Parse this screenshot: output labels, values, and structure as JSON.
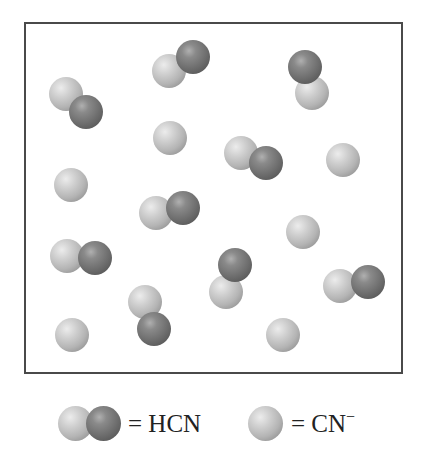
{
  "diagram": {
    "title": "",
    "container": {
      "left": 24,
      "top": 22,
      "right": 403,
      "bottom": 374,
      "border_color": "#4a4a4a"
    },
    "sphere_colors": {
      "light": "#c0c0c0",
      "dark": "#6f6f6f"
    },
    "sphere_radius": 17,
    "molecules": [
      {
        "type": "HCN",
        "spheres": [
          {
            "shade": "light",
            "x": 66,
            "y": 94
          },
          {
            "shade": "dark",
            "x": 86,
            "y": 112
          }
        ]
      },
      {
        "type": "HCN",
        "spheres": [
          {
            "shade": "dark",
            "x": 193,
            "y": 57
          },
          {
            "shade": "light",
            "x": 169,
            "y": 71
          }
        ]
      },
      {
        "type": "HCN",
        "spheres": [
          {
            "shade": "dark",
            "x": 305,
            "y": 67
          },
          {
            "shade": "light",
            "x": 312,
            "y": 93
          }
        ]
      },
      {
        "type": "CN-",
        "spheres": [
          {
            "shade": "light",
            "x": 170,
            "y": 138
          }
        ]
      },
      {
        "type": "HCN",
        "spheres": [
          {
            "shade": "light",
            "x": 241,
            "y": 153
          },
          {
            "shade": "dark",
            "x": 266,
            "y": 163
          }
        ]
      },
      {
        "type": "CN-",
        "spheres": [
          {
            "shade": "light",
            "x": 343,
            "y": 160
          }
        ]
      },
      {
        "type": "CN-",
        "spheres": [
          {
            "shade": "light",
            "x": 71,
            "y": 185
          }
        ]
      },
      {
        "type": "HCN",
        "spheres": [
          {
            "shade": "light",
            "x": 156,
            "y": 213
          },
          {
            "shade": "dark",
            "x": 183,
            "y": 208
          }
        ]
      },
      {
        "type": "CN-",
        "spheres": [
          {
            "shade": "light",
            "x": 303,
            "y": 232
          }
        ]
      },
      {
        "type": "HCN",
        "spheres": [
          {
            "shade": "light",
            "x": 67,
            "y": 256
          },
          {
            "shade": "dark",
            "x": 95,
            "y": 258
          }
        ]
      },
      {
        "type": "HCN",
        "spheres": [
          {
            "shade": "dark",
            "x": 235,
            "y": 265
          },
          {
            "shade": "light",
            "x": 226,
            "y": 292
          }
        ]
      },
      {
        "type": "HCN",
        "spheres": [
          {
            "shade": "light",
            "x": 340,
            "y": 286
          },
          {
            "shade": "dark",
            "x": 368,
            "y": 282
          }
        ]
      },
      {
        "type": "HCN",
        "spheres": [
          {
            "shade": "light",
            "x": 145,
            "y": 302
          },
          {
            "shade": "dark",
            "x": 154,
            "y": 329
          }
        ]
      },
      {
        "type": "CN-",
        "spheres": [
          {
            "shade": "light",
            "x": 72,
            "y": 335
          }
        ]
      },
      {
        "type": "CN-",
        "spheres": [
          {
            "shade": "light",
            "x": 283,
            "y": 335
          }
        ]
      }
    ],
    "counts": {
      "HCN": 9,
      "CN-": 6
    }
  },
  "legend": {
    "hcn": {
      "equals": "=",
      "label": "HCN"
    },
    "cn": {
      "equals": "=",
      "label": "CN",
      "charge": "−"
    }
  }
}
